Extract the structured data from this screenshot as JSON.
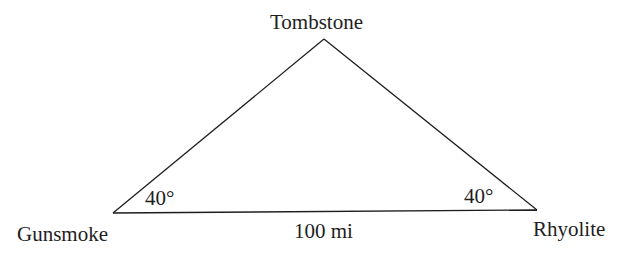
{
  "diagram": {
    "type": "triangle",
    "vertices": [
      {
        "name": "Tombstone",
        "x": 324,
        "y": 39
      },
      {
        "name": "Gunsmoke",
        "x": 113,
        "y": 213
      },
      {
        "name": "Rhyolite",
        "x": 537,
        "y": 210
      }
    ],
    "labels": {
      "top": "Tombstone",
      "bottom_left": "Gunsmoke",
      "bottom_right": "Rhyolite",
      "base_length": "100 mi",
      "left_angle": "40°",
      "right_angle": "40°"
    },
    "colors": {
      "line": "#1e1e1e",
      "text": "#1e1e1e",
      "background": "#ffffff"
    }
  }
}
